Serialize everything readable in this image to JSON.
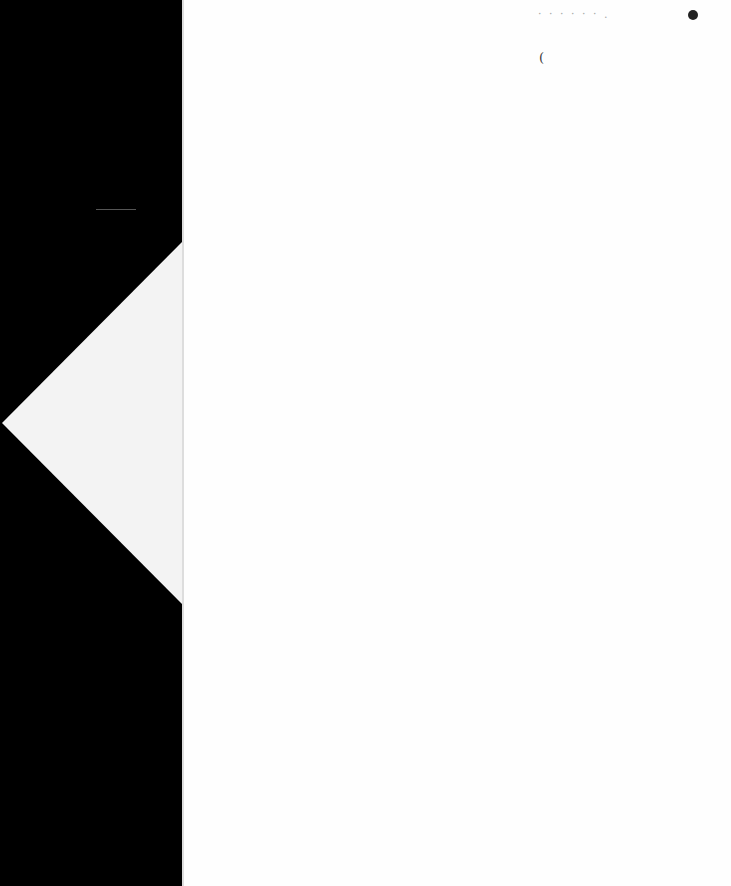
{
  "document": {
    "type": "scanned-page",
    "header_marks": "· · · · · · .",
    "margin_mark": "("
  }
}
